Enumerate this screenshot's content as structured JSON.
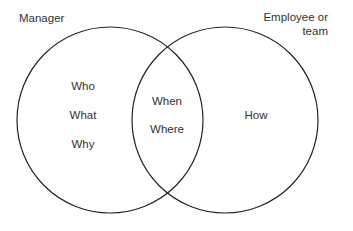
{
  "diagram": {
    "type": "venn",
    "sets": [
      {
        "id": "manager",
        "label": "Manager",
        "items": [
          "Who",
          "What",
          "Why"
        ]
      },
      {
        "id": "employee",
        "label_line1": "Employee or",
        "label_line2": "team",
        "items": [
          "How"
        ]
      }
    ],
    "intersection": {
      "items": [
        "When",
        "Where"
      ]
    },
    "colors": {
      "stroke": "#222222",
      "text": "#333333",
      "background": "#ffffff"
    }
  }
}
